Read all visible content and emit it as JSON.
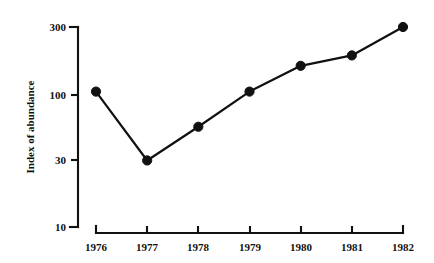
{
  "chart_data": {
    "type": "line",
    "title": "",
    "xlabel": "",
    "ylabel": "Index of abundance",
    "x": [
      1976,
      1977,
      1978,
      1979,
      1980,
      1981,
      1982
    ],
    "xtick_labels": [
      "1976",
      "1977",
      "1978",
      "1979",
      "1980",
      "1981",
      "1982"
    ],
    "values": [
      100,
      31,
      55,
      100,
      155,
      185,
      300
    ],
    "yscale": "log",
    "ylim": [
      10,
      300
    ],
    "ytick_values": [
      10,
      30,
      100,
      300
    ],
    "ytick_labels": [
      "10",
      "30",
      "100",
      "300"
    ],
    "xlim": [
      1976,
      1982
    ],
    "grid": false,
    "legend": false,
    "marker": "filled-circle",
    "line_color": "#111111",
    "marker_color": "#111111",
    "background_color": "#ffffff",
    "series": [
      {
        "name": "Index of abundance",
        "values": [
          100,
          31,
          55,
          100,
          155,
          185,
          300
        ]
      }
    ],
    "points": [
      {
        "x": "1976",
        "y": 100
      },
      {
        "x": "1977",
        "y": 31
      },
      {
        "x": "1978",
        "y": 55
      },
      {
        "x": "1979",
        "y": 100
      },
      {
        "x": "1980",
        "y": 155
      },
      {
        "x": "1981",
        "y": 185
      },
      {
        "x": "1982",
        "y": 300
      }
    ]
  },
  "axes": {
    "y_title": "Index of abundance",
    "y_ticks": [
      {
        "label": "300"
      },
      {
        "label": "100"
      },
      {
        "label": "30"
      },
      {
        "label": "10"
      }
    ],
    "x_ticks": [
      {
        "label": "1976"
      },
      {
        "label": "1977"
      },
      {
        "label": "1978"
      },
      {
        "label": "1979"
      },
      {
        "label": "1980"
      },
      {
        "label": "1981"
      },
      {
        "label": "1982"
      }
    ]
  }
}
